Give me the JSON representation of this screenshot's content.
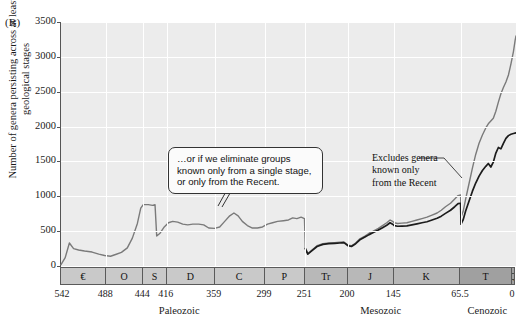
{
  "figure": {
    "panel_label": "(B)",
    "ylabel": "Number of genera persisting across at least two geological stages"
  },
  "annotations": {
    "callout_text": "…or if we eliminate groups known only from a single stage, or only from the Recent.",
    "excludes_line1": "Excludes genera",
    "excludes_line2": "known only",
    "excludes_line3": "from the Recent"
  },
  "axes": {
    "y_ticks": [
      "0",
      "500",
      "1000",
      "1500",
      "2000",
      "2500",
      "3000",
      "3500"
    ],
    "x_ticks": [
      "542",
      "488",
      "444",
      "416",
      "359",
      "299",
      "251",
      "200",
      "145",
      "65.5",
      "0"
    ]
  },
  "timescale": {
    "periods": [
      {
        "label": "€",
        "start": 542,
        "end": 488,
        "era": "Paleozoic",
        "color": "#c9c9c9"
      },
      {
        "label": "O",
        "start": 488,
        "end": 444,
        "era": "Paleozoic",
        "color": "#c9c9c9"
      },
      {
        "label": "S",
        "start": 444,
        "end": 416,
        "era": "Paleozoic",
        "color": "#c9c9c9"
      },
      {
        "label": "D",
        "start": 416,
        "end": 359,
        "era": "Paleozoic",
        "color": "#c9c9c9"
      },
      {
        "label": "C",
        "start": 359,
        "end": 299,
        "era": "Paleozoic",
        "color": "#c9c9c9"
      },
      {
        "label": "P",
        "start": 299,
        "end": 251,
        "era": "Paleozoic",
        "color": "#c9c9c9"
      },
      {
        "label": "Tr",
        "start": 251,
        "end": 200,
        "era": "Mesozoic",
        "color": "#b8b8b8"
      },
      {
        "label": "J",
        "start": 200,
        "end": 145,
        "era": "Mesozoic",
        "color": "#b8b8b8"
      },
      {
        "label": "K",
        "start": 145,
        "end": 65.5,
        "era": "Mesozoic",
        "color": "#b8b8b8"
      },
      {
        "label": "T",
        "start": 65.5,
        "end": 2,
        "era": "Cenozoic",
        "color": "#a0a0a0"
      },
      {
        "label": "Q",
        "start": 2,
        "end": 0,
        "era": "Cenozoic",
        "color": "#a0a0a0"
      }
    ],
    "eras": [
      {
        "label": "Paleozoic",
        "center_ma": 400
      },
      {
        "label": "Mesozoic",
        "center_ma": 160
      },
      {
        "label": "Cenozoic",
        "center_ma": 33
      }
    ]
  },
  "colors": {
    "plot_background": "#ececec",
    "gridline": "#ffffff",
    "gray_curve": "#7a7a7a",
    "black_curve": "#1c1c1c",
    "axis": "#555555",
    "paleozoic_band": "#c9c9c9",
    "mesozoic_band": "#b8b8b8",
    "cenozoic_band": "#a0a0a0"
  },
  "chart_data": {
    "type": "line",
    "title": "",
    "xlabel": "",
    "ylabel": "Number of genera persisting across at least two geological stages",
    "xlim": [
      542,
      0
    ],
    "ylim": [
      0,
      3500
    ],
    "x_axis_inverted": true,
    "grid": true,
    "legend_position": "annotations",
    "series": [
      {
        "name": "Includes genera known only from the Recent",
        "color": "#7a7a7a",
        "points": [
          [
            542,
            20
          ],
          [
            537,
            120
          ],
          [
            532,
            330
          ],
          [
            527,
            250
          ],
          [
            521,
            230
          ],
          [
            514,
            215
          ],
          [
            505,
            200
          ],
          [
            497,
            170
          ],
          [
            490,
            150
          ],
          [
            483,
            140
          ],
          [
            477,
            165
          ],
          [
            470,
            195
          ],
          [
            463,
            260
          ],
          [
            457,
            400
          ],
          [
            451,
            610
          ],
          [
            447,
            830
          ],
          [
            444,
            880
          ],
          [
            438,
            880
          ],
          [
            433,
            870
          ],
          [
            430,
            880
          ],
          [
            428,
            430
          ],
          [
            424,
            470
          ],
          [
            419,
            560
          ],
          [
            414,
            620
          ],
          [
            409,
            640
          ],
          [
            403,
            630
          ],
          [
            397,
            600
          ],
          [
            391,
            590
          ],
          [
            385,
            600
          ],
          [
            378,
            600
          ],
          [
            372,
            590
          ],
          [
            366,
            545
          ],
          [
            359,
            540
          ],
          [
            353,
            560
          ],
          [
            347,
            640
          ],
          [
            341,
            720
          ],
          [
            336,
            760
          ],
          [
            331,
            720
          ],
          [
            326,
            640
          ],
          [
            320,
            580
          ],
          [
            314,
            545
          ],
          [
            308,
            545
          ],
          [
            302,
            560
          ],
          [
            296,
            600
          ],
          [
            290,
            620
          ],
          [
            284,
            640
          ],
          [
            277,
            650
          ],
          [
            271,
            660
          ],
          [
            266,
            690
          ],
          [
            261,
            680
          ],
          [
            256,
            700
          ],
          [
            252,
            680
          ],
          [
            251,
            260
          ],
          [
            248,
            180
          ],
          [
            243,
            230
          ],
          [
            237,
            290
          ],
          [
            230,
            320
          ],
          [
            223,
            330
          ],
          [
            216,
            335
          ],
          [
            210,
            340
          ],
          [
            205,
            345
          ],
          [
            200,
            300
          ],
          [
            196,
            290
          ],
          [
            191,
            330
          ],
          [
            186,
            390
          ],
          [
            180,
            430
          ],
          [
            175,
            470
          ],
          [
            170,
            500
          ],
          [
            164,
            540
          ],
          [
            159,
            580
          ],
          [
            154,
            620
          ],
          [
            150,
            660
          ],
          [
            147,
            640
          ],
          [
            145,
            620
          ],
          [
            141,
            610
          ],
          [
            136,
            615
          ],
          [
            130,
            620
          ],
          [
            124,
            640
          ],
          [
            118,
            660
          ],
          [
            112,
            680
          ],
          [
            106,
            700
          ],
          [
            100,
            730
          ],
          [
            94,
            760
          ],
          [
            89,
            800
          ],
          [
            84,
            850
          ],
          [
            78,
            900
          ],
          [
            73,
            960
          ],
          [
            69,
            1010
          ],
          [
            66,
            1020
          ],
          [
            65.5,
            700
          ],
          [
            63,
            780
          ],
          [
            60,
            960
          ],
          [
            56,
            1180
          ],
          [
            52,
            1400
          ],
          [
            48,
            1600
          ],
          [
            44,
            1760
          ],
          [
            40,
            1880
          ],
          [
            36,
            1980
          ],
          [
            33,
            2040
          ],
          [
            30,
            2080
          ],
          [
            27,
            2120
          ],
          [
            24,
            2220
          ],
          [
            21,
            2350
          ],
          [
            18,
            2470
          ],
          [
            15,
            2560
          ],
          [
            12,
            2640
          ],
          [
            9,
            2740
          ],
          [
            6,
            2900
          ],
          [
            3,
            3080
          ],
          [
            1,
            3240
          ],
          [
            0,
            3300
          ]
        ]
      },
      {
        "name": "Excludes genera known only from the Recent",
        "color": "#1c1c1c",
        "points": [
          [
            251,
            250
          ],
          [
            248,
            170
          ],
          [
            243,
            220
          ],
          [
            237,
            280
          ],
          [
            230,
            310
          ],
          [
            223,
            320
          ],
          [
            216,
            325
          ],
          [
            210,
            330
          ],
          [
            205,
            335
          ],
          [
            200,
            290
          ],
          [
            196,
            280
          ],
          [
            191,
            320
          ],
          [
            186,
            375
          ],
          [
            180,
            415
          ],
          [
            175,
            450
          ],
          [
            170,
            480
          ],
          [
            164,
            515
          ],
          [
            159,
            550
          ],
          [
            154,
            585
          ],
          [
            150,
            620
          ],
          [
            147,
            600
          ],
          [
            145,
            580
          ],
          [
            141,
            570
          ],
          [
            136,
            572
          ],
          [
            130,
            575
          ],
          [
            124,
            590
          ],
          [
            118,
            605
          ],
          [
            112,
            620
          ],
          [
            106,
            635
          ],
          [
            100,
            660
          ],
          [
            94,
            685
          ],
          [
            89,
            715
          ],
          [
            84,
            755
          ],
          [
            78,
            800
          ],
          [
            73,
            850
          ],
          [
            69,
            895
          ],
          [
            66,
            900
          ],
          [
            65.5,
            600
          ],
          [
            63,
            660
          ],
          [
            60,
            790
          ],
          [
            56,
            930
          ],
          [
            52,
            1070
          ],
          [
            48,
            1190
          ],
          [
            44,
            1290
          ],
          [
            40,
            1370
          ],
          [
            36,
            1430
          ],
          [
            33,
            1470
          ],
          [
            30,
            1420
          ],
          [
            27,
            1490
          ],
          [
            24,
            1620
          ],
          [
            21,
            1700
          ],
          [
            18,
            1680
          ],
          [
            15,
            1760
          ],
          [
            12,
            1830
          ],
          [
            9,
            1870
          ],
          [
            6,
            1890
          ],
          [
            3,
            1900
          ],
          [
            0,
            1910
          ]
        ]
      }
    ]
  }
}
